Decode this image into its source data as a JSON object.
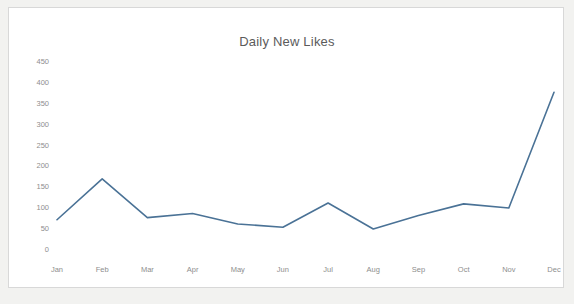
{
  "card": {
    "background_color": "#ffffff",
    "border_color": "#d8d8d8"
  },
  "page": {
    "background_color": "#f2f2f0"
  },
  "chart_data": {
    "type": "line",
    "title": "Daily New Likes",
    "xlabel": "",
    "ylabel": "",
    "categories": [
      "Jan",
      "Feb",
      "Mar",
      "Apr",
      "May",
      "Jun",
      "Jul",
      "Aug",
      "Sep",
      "Oct",
      "Nov",
      "Dec"
    ],
    "values": [
      70,
      168,
      75,
      85,
      60,
      52,
      110,
      48,
      80,
      108,
      98,
      375
    ],
    "series": [
      {
        "name": "Daily New Likes",
        "values": [
          70,
          168,
          75,
          85,
          60,
          52,
          110,
          48,
          80,
          108,
          98,
          375
        ],
        "color": "#4a7296"
      }
    ],
    "yticks": [
      0,
      50,
      100,
      150,
      200,
      250,
      300,
      350,
      400,
      450
    ],
    "ytick_labels": [
      "0",
      "50",
      "100",
      "150",
      "200",
      "250",
      "300",
      "350",
      "400",
      "450"
    ],
    "ylim": [
      0,
      450
    ],
    "grid": false,
    "legend": false,
    "legend_position": "none",
    "line_color": "#4a7296",
    "markers": false,
    "tick_color": "#8e8e8e",
    "title_color": "#5b5b5b"
  }
}
